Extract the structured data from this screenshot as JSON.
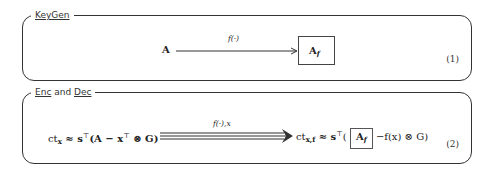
{
  "panels": [
    {
      "title": "KeyGen",
      "equation_number": "(1)",
      "source": "A",
      "arrow_label": "f(·)",
      "target": "A",
      "target_sub": "f"
    },
    {
      "title_part1": "Enc",
      "title_and": " and ",
      "title_part2": "Dec",
      "equation_number": "(2)",
      "lhs_ct": "ct",
      "lhs_ct_sub": "x",
      "lhs_rest": " ≈ s",
      "lhs_T": "⊤",
      "lhs_paren": "(A − x",
      "lhs_T2": "⊤",
      "lhs_tail": " ⊗ G)",
      "arrow_label": "f(·),x",
      "rhs_ct": "ct",
      "rhs_ct_sub": "x,f",
      "rhs_approx": " ≈ s",
      "rhs_T": "⊤",
      "rhs_open": "( ",
      "rhs_boxed": "A",
      "rhs_boxed_sub": "f",
      "rhs_tail": " −f(x) ⊗ G)"
    }
  ]
}
